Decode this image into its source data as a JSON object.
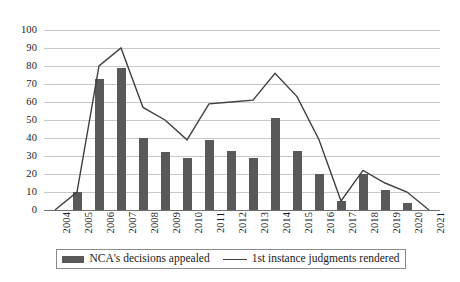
{
  "chart_data": {
    "type": "bar",
    "title": "",
    "subtitle": "",
    "xlabel": "",
    "ylabel": "",
    "ylim": [
      0,
      100
    ],
    "ytick_step": 10,
    "yticks": [
      0,
      10,
      20,
      30,
      40,
      50,
      60,
      70,
      80,
      90,
      100
    ],
    "grid": true,
    "legend_position": "bottom",
    "categories": [
      "2004",
      "2005",
      "2006",
      "2007",
      "2008",
      "2009",
      "2010",
      "2011",
      "2012",
      "2013",
      "2014",
      "2015",
      "2016",
      "2017",
      "2018",
      "2019",
      "2020",
      "2021"
    ],
    "series": [
      {
        "name": "NCA's decisions appealed",
        "type": "bar",
        "color": "#595959",
        "values": [
          0,
          10,
          73,
          79,
          40,
          32,
          29,
          39,
          33,
          29,
          51,
          33,
          20,
          5,
          20,
          11,
          4,
          0
        ]
      },
      {
        "name": "1st instance judgments rendered",
        "type": "line",
        "color": "#404040",
        "values": [
          0,
          10,
          80,
          90,
          57,
          50,
          39,
          59,
          60,
          61,
          76,
          63,
          39,
          5,
          22,
          15,
          10,
          0
        ]
      }
    ]
  },
  "legend": {
    "entries": [
      {
        "label": "NCA's decisions appealed",
        "marker": "bar-swatch"
      },
      {
        "label": "1st instance judgments rendered",
        "marker": "line-swatch"
      }
    ]
  },
  "axes": {
    "y_tick_labels": [
      "100",
      "90",
      "80",
      "70",
      "60",
      "50",
      "40",
      "30",
      "20",
      "10",
      "0"
    ],
    "x_tick_labels": [
      "2004",
      "2005",
      "2006",
      "2007",
      "2008",
      "2009",
      "2010",
      "2011",
      "2012",
      "2013",
      "2014",
      "2015",
      "2016",
      "2017",
      "2018",
      "2019",
      "2020",
      "2021"
    ]
  },
  "colors": {
    "bar": "#595959",
    "line": "#404040",
    "gridline": "#c9c9c9",
    "axis": "#6f6f6f",
    "background": "#ffffff",
    "text": "#1a1a1a"
  }
}
